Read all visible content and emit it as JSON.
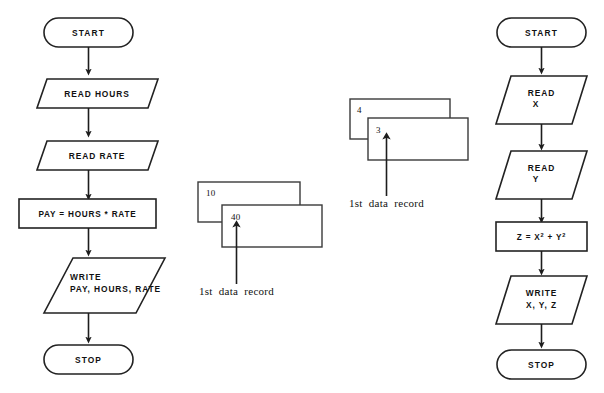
{
  "diagram": {
    "stroke_color": "#222222",
    "text_color": "#111111",
    "background": "#ffffff"
  },
  "left_flowchart": {
    "name": "pay-calculation-flowchart",
    "nodes": [
      {
        "id": "start",
        "shape": "terminator",
        "text": "START"
      },
      {
        "id": "read1",
        "shape": "parallelogram",
        "text": "READ HOURS"
      },
      {
        "id": "read2",
        "shape": "parallelogram",
        "text": "READ RATE"
      },
      {
        "id": "process",
        "shape": "rectangle",
        "text": "PAY = HOURS * RATE"
      },
      {
        "id": "write",
        "shape": "parallelogram",
        "line1": "WRITE",
        "line2": "PAY, HOURS, RATE"
      },
      {
        "id": "stop",
        "shape": "terminator",
        "text": "STOP"
      }
    ]
  },
  "right_flowchart": {
    "name": "sum-of-squares-flowchart",
    "nodes": [
      {
        "id": "start",
        "shape": "terminator",
        "text": "START"
      },
      {
        "id": "readx",
        "shape": "parallelogram",
        "line1": "READ",
        "line2": "X"
      },
      {
        "id": "ready",
        "shape": "parallelogram",
        "line1": "READ",
        "line2": "Y"
      },
      {
        "id": "compute",
        "shape": "rectangle",
        "text": "Z = X2 + Y2",
        "base": "Z = X",
        "exp1": "2",
        "mid": " + Y",
        "exp2": "2"
      },
      {
        "id": "write",
        "shape": "parallelogram",
        "line1": "WRITE",
        "line2": "X, Y, Z"
      },
      {
        "id": "stop",
        "shape": "terminator",
        "text": "STOP"
      }
    ]
  },
  "left_card_stack": {
    "name": "pay-data-records",
    "back_card_value": "10",
    "front_card_value": "40",
    "caption": "1st  data  record"
  },
  "right_card_stack": {
    "name": "xy-data-records",
    "back_card_value": "4",
    "front_card_value": "3",
    "caption": "1st  data  record"
  }
}
